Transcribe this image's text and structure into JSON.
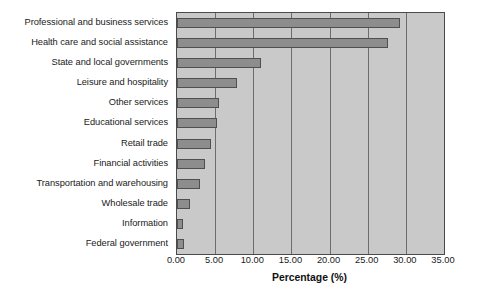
{
  "chart_data": {
    "type": "bar",
    "orientation": "horizontal",
    "title": "",
    "xlabel": "Percentage (%)",
    "ylabel": "",
    "xlim": [
      0,
      35
    ],
    "xticks": [
      "0.00",
      "5.00",
      "10.00",
      "15.00",
      "20.00",
      "25.00",
      "30.00",
      "35.00"
    ],
    "xtick_values": [
      0,
      5,
      10,
      15,
      20,
      25,
      30,
      35
    ],
    "grid": true,
    "grid_axis": "x",
    "legend": false,
    "categories": [
      "Professional and business services",
      "Health care and social assistance",
      "State and local governments",
      "Leisure and hospitality",
      "Other services",
      "Educational services",
      "Retail trade",
      "Financial activities",
      "Transportation and warehousing",
      "Wholesale trade",
      "Information",
      "Federal government"
    ],
    "values": [
      29.2,
      27.7,
      11.0,
      7.9,
      5.5,
      5.3,
      4.4,
      3.7,
      3.0,
      1.7,
      0.8,
      0.9
    ],
    "colors": {
      "bar_fill": "#8d8d8d",
      "bar_edge": "#4f4f4f",
      "plot_background": "#c9c9c9",
      "gridline": "#6d6d6d",
      "axis": "#4a4a4a",
      "text": "#1a1a1a",
      "figure_background": "#ffffff"
    }
  }
}
